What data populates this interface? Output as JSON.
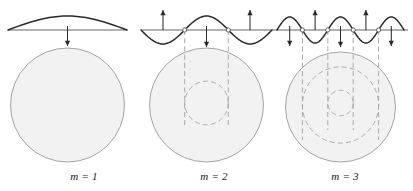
{
  "figure": {
    "type": "physics-diagram",
    "background_color": "#ffffff",
    "width": 413,
    "height": 191
  },
  "style": {
    "wave_stroke": "#2b2b2b",
    "baseline_stroke": "#4a4a4a",
    "circle_stroke": "#9a9a9a",
    "circle_fill": "#f2f2f2",
    "dashed_stroke": "#a5a5a5",
    "arrow_stroke": "#2b2b2b",
    "node_fill": "#ffffff",
    "node_stroke": "#555555",
    "caption_color": "#171717"
  },
  "panels": [
    {
      "id": "panel-m1",
      "caption": "m = 1",
      "caption_x": 84,
      "caption_y": 170,
      "baseline": {
        "y": 30,
        "x1": 8,
        "x2": 127
      },
      "wave": {
        "x_start": 8,
        "x_end": 127,
        "lobes": 1,
        "amplitude": 14,
        "signs": [
          1
        ]
      },
      "arrows": [
        {
          "x": 67.5,
          "direction": "down",
          "y_top": 26,
          "y_bottom": 46
        }
      ],
      "nodes": [],
      "dashed_lines": [],
      "circles": [
        {
          "cx": 67.5,
          "cy": 105,
          "r": 57,
          "style": "solid"
        }
      ]
    },
    {
      "id": "panel-m2",
      "caption": "m = 2",
      "caption_x": 214,
      "caption_y": 170,
      "baseline": {
        "y": 30,
        "x1": 141,
        "x2": 272
      },
      "wave": {
        "x_start": 141,
        "x_end": 272,
        "lobes": 3,
        "amplitude": 14,
        "signs": [
          -1,
          1,
          -1
        ]
      },
      "arrows": [
        {
          "x": 163,
          "direction": "up",
          "y_top": 10,
          "y_bottom": 30
        },
        {
          "x": 206.5,
          "direction": "down",
          "y_top": 26,
          "y_bottom": 47
        },
        {
          "x": 250,
          "direction": "up",
          "y_top": 10,
          "y_bottom": 30
        }
      ],
      "nodes": [
        {
          "x": 184.7,
          "y": 30
        },
        {
          "x": 228.3,
          "y": 30
        }
      ],
      "dashed_lines": [
        {
          "x": 184.7,
          "y1": 30,
          "y2": 125
        },
        {
          "x": 228.3,
          "y1": 30,
          "y2": 125
        }
      ],
      "circles": [
        {
          "cx": 206.5,
          "cy": 105,
          "r": 57,
          "style": "solid"
        },
        {
          "cx": 206.5,
          "cy": 103,
          "r": 21.8,
          "style": "dashed"
        }
      ]
    },
    {
      "id": "panel-m3",
      "caption": "m = 3",
      "caption_x": 345,
      "caption_y": 170,
      "baseline": {
        "y": 30,
        "x1": 272,
        "x2": 408
      },
      "wave": {
        "x_start": 277,
        "x_end": 404,
        "lobes": 5,
        "amplitude": 13,
        "signs": [
          1,
          -1,
          1,
          -1,
          1
        ]
      },
      "arrows": [
        {
          "x": 289.7,
          "direction": "down",
          "y_top": 26,
          "y_bottom": 46
        },
        {
          "x": 315.1,
          "direction": "up",
          "y_top": 10,
          "y_bottom": 30
        },
        {
          "x": 340.5,
          "direction": "down",
          "y_top": 26,
          "y_bottom": 47
        },
        {
          "x": 365.9,
          "direction": "up",
          "y_top": 10,
          "y_bottom": 30
        },
        {
          "x": 391.3,
          "direction": "down",
          "y_top": 26,
          "y_bottom": 46
        }
      ],
      "nodes": [
        {
          "x": 302.4,
          "y": 30
        },
        {
          "x": 327.8,
          "y": 30
        },
        {
          "x": 353.2,
          "y": 30
        },
        {
          "x": 378.6,
          "y": 30
        }
      ],
      "dashed_lines": [
        {
          "x": 302.4,
          "y1": 30,
          "y2": 140
        },
        {
          "x": 327.8,
          "y1": 30,
          "y2": 130
        },
        {
          "x": 353.2,
          "y1": 30,
          "y2": 130
        },
        {
          "x": 378.6,
          "y1": 30,
          "y2": 140
        }
      ],
      "circles": [
        {
          "cx": 340.5,
          "cy": 107,
          "r": 55,
          "style": "solid"
        },
        {
          "cx": 340.5,
          "cy": 105,
          "r": 38.1,
          "style": "dashed"
        },
        {
          "cx": 340.5,
          "cy": 103,
          "r": 12.7,
          "style": "dashed"
        }
      ]
    }
  ]
}
